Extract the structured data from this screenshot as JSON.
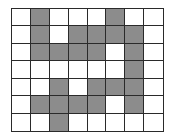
{
  "grid": {
    "columns": 8,
    "rows": 7,
    "filled_color": "#8c8c8c",
    "empty_color": "#ffffff",
    "line_color": "#2a2a2a",
    "cells": [
      [
        0,
        1,
        0,
        0,
        0,
        1,
        0,
        0
      ],
      [
        0,
        1,
        0,
        1,
        1,
        1,
        1,
        0
      ],
      [
        0,
        1,
        1,
        1,
        1,
        0,
        1,
        0
      ],
      [
        0,
        0,
        0,
        0,
        0,
        0,
        1,
        0
      ],
      [
        0,
        0,
        1,
        0,
        1,
        1,
        1,
        0
      ],
      [
        0,
        1,
        1,
        1,
        1,
        0,
        1,
        0
      ],
      [
        0,
        0,
        1,
        0,
        0,
        0,
        0,
        0
      ]
    ]
  }
}
